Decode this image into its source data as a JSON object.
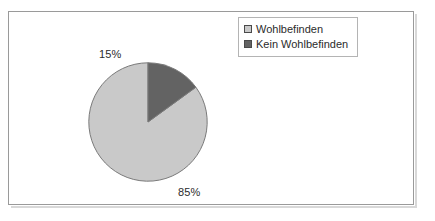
{
  "chart_data": {
    "type": "pie",
    "title": "",
    "subtitle": "",
    "xlabel": "",
    "ylabel": "",
    "grid": false,
    "legend_position": "top-right",
    "categories": [
      "Wohlbefinden",
      "Kein Wohlbefinden"
    ],
    "values": [
      85,
      15
    ],
    "value_labels": [
      "85%",
      "15%"
    ],
    "colors": [
      "#c9c9c9",
      "#636363"
    ],
    "slices": [
      {
        "label": "Wohlbefinden",
        "value": 85,
        "value_label": "85%",
        "color": "#c9c9c9",
        "start_angle_deg": 0,
        "sweep_deg": 306,
        "direction": "counterclockwise"
      },
      {
        "label": "Kein Wohlbefinden",
        "value": 15,
        "value_label": "15%",
        "color": "#636363",
        "start_angle_deg": 306,
        "sweep_deg": 54,
        "direction": "counterclockwise"
      }
    ]
  },
  "legend": {
    "entries": [
      {
        "label": "Wohlbefinden",
        "color": "#c9c9c9"
      },
      {
        "label": "Kein Wohlbefinden",
        "color": "#636363"
      }
    ]
  },
  "labels": {
    "slice_1": "85%",
    "slice_2": "15%"
  },
  "style": {
    "frame_border": "#9a9a9a",
    "slice_outline": "#7a7a7a",
    "text_color": "#2b2b2b"
  }
}
